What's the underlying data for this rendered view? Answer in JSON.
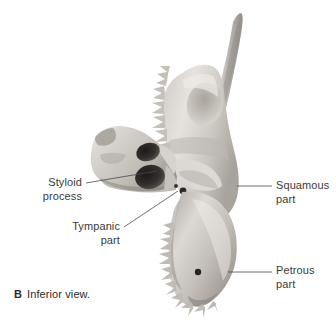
{
  "figure": {
    "caption_letter": "B",
    "caption_text": "Inferior view.",
    "background_color": "#ffffff",
    "text_color": "#3b3b3b",
    "leader_color": "#4a4a4a"
  },
  "specimen": {
    "name": "temporal-bone",
    "description": "Isolated human temporal bone, inferior view photograph",
    "bone_light": "#e8e6e3",
    "bone_mid": "#c9c5c0",
    "bone_dark": "#9a958f",
    "bone_shadow": "#726d68",
    "foramen_color": "#2e2b29"
  },
  "labels": [
    {
      "id": "styloid-process",
      "line1": "Styloid",
      "line2": "process",
      "align": "right",
      "leader": {
        "x1": 86,
        "y1": 183,
        "x2": 157,
        "y2": 171
      }
    },
    {
      "id": "tympanic-part",
      "line1": "Tympanic",
      "line2": "part",
      "align": "right",
      "leader": {
        "x1": 124,
        "y1": 227,
        "x2": 178,
        "y2": 191
      }
    },
    {
      "id": "squamous-part",
      "line1": "Squamous",
      "line2": "part",
      "align": "left",
      "leader": {
        "x1": 237,
        "y1": 186,
        "x2": 272,
        "y2": 186
      }
    },
    {
      "id": "petrous-part",
      "line1": "Petrous",
      "line2": "part",
      "align": "left",
      "leader": {
        "x1": 228,
        "y1": 272,
        "x2": 272,
        "y2": 272
      }
    }
  ]
}
